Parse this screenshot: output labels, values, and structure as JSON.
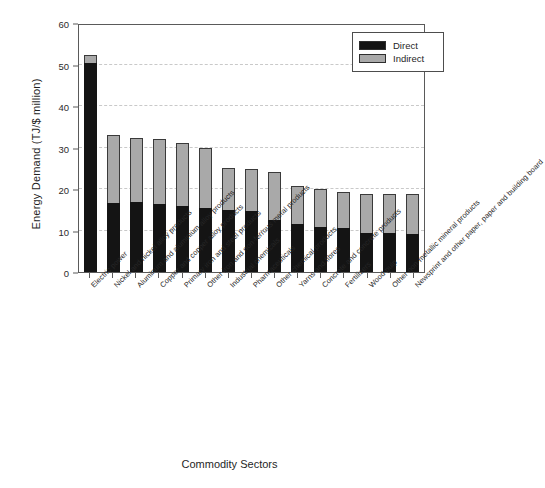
{
  "chart_data": {
    "type": "bar",
    "subtype": "stacked-vertical",
    "title": "",
    "xlabel": "Commodity Sectors",
    "ylabel": "Energy Demand (TJ/$ million)",
    "ylim": [
      0,
      60
    ],
    "yticks": [
      0,
      10,
      20,
      30,
      40,
      50,
      60
    ],
    "grid": "horizontal-dashed",
    "legend_position": "top-right",
    "legend": [
      "Direct",
      "Indirect"
    ],
    "colors": {
      "direct": "#141414",
      "indirect": "#a9a9a9",
      "frame": "#5a5a5a",
      "grid": "#c9c9c9"
    },
    "categories": [
      "Electric power",
      "Nickel and nickel alloy products",
      "Aluminum and aluminium alloy products",
      "Copper and copper alloy products",
      "Primary iron and steel products",
      "Other iron and non-ferrous metal products",
      "Industrial chemicals",
      "Pharmaceuticals",
      "Other chemical products",
      "Yarns and fibres",
      "Concrete and concrete products",
      "Fertilizers",
      "Wood pulp",
      "Other non-metallic mineral products",
      "Newsprint and other paper, paper and building board"
    ],
    "series": [
      {
        "name": "Direct",
        "values": [
          50.4,
          16.7,
          16.8,
          16.4,
          15.9,
          15.4,
          14.9,
          14.7,
          12.6,
          11.6,
          10.9,
          10.6,
          9.3,
          9.3,
          9.1
        ]
      },
      {
        "name": "Indirect",
        "values": [
          1.9,
          16.3,
          15.5,
          15.6,
          15.1,
          14.4,
          10.1,
          10.1,
          11.4,
          9.2,
          9.2,
          8.6,
          9.6,
          9.6,
          9.6
        ]
      }
    ],
    "totals": [
      52.3,
      33.0,
      32.3,
      32.0,
      31.0,
      29.8,
      25.0,
      24.8,
      24.0,
      20.8,
      20.1,
      19.2,
      18.9,
      18.9,
      18.7
    ]
  },
  "axis": {
    "y_title": "Energy Demand (TJ/$ million)",
    "x_title": "Commodity Sectors",
    "y_tick_labels": [
      "60",
      "50",
      "40",
      "30",
      "20",
      "10",
      "0"
    ]
  },
  "legend": {
    "items": [
      {
        "label": "Direct",
        "swatch": "black-swatch-icon"
      },
      {
        "label": "Indirect",
        "swatch": "gray-swatch-icon"
      }
    ]
  }
}
